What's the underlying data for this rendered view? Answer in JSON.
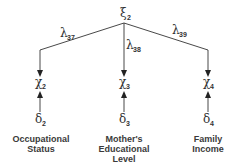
{
  "diagram": {
    "type": "measurement-model",
    "latent": {
      "symbol": "ξ",
      "subscript": "2"
    },
    "paths": [
      {
        "symbol": "λ",
        "subscript": "37"
      },
      {
        "symbol": "λ",
        "subscript": "38"
      },
      {
        "symbol": "λ",
        "subscript": "39"
      }
    ],
    "indicators": [
      {
        "symbol": "χ",
        "subscript": "2",
        "error": {
          "symbol": "δ",
          "subscript": "2"
        },
        "label_lines": [
          "Occupational",
          "Status"
        ]
      },
      {
        "symbol": "χ",
        "subscript": "3",
        "error": {
          "symbol": "δ",
          "subscript": "3"
        },
        "label_lines": [
          "Mother's",
          "Educational",
          "Level"
        ]
      },
      {
        "symbol": "χ",
        "subscript": "4",
        "error": {
          "symbol": "δ",
          "subscript": "4"
        },
        "label_lines": [
          "Family",
          "Income"
        ]
      }
    ],
    "colors": {
      "line": "#333333",
      "text": "#3a3a3a"
    }
  }
}
